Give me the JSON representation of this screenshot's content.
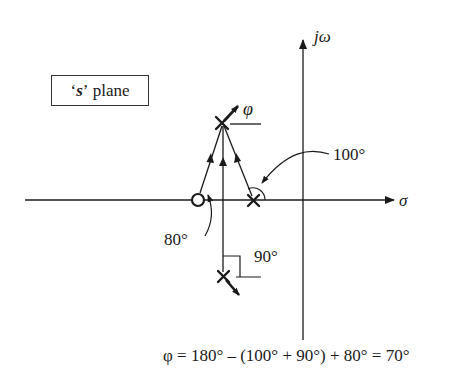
{
  "diagram": {
    "title_box": {
      "quote_open": "‘",
      "variable": "s",
      "quote_close": "’",
      "suffix": " plane"
    },
    "axes": {
      "imaginary_label": "jω",
      "real_label": "σ"
    },
    "departure_angle_label": "φ",
    "angle_labels": {
      "pole_right": "100°",
      "zero": "80°",
      "pole_lower": "90°"
    },
    "equation": "φ = 180° – (100° + 90°) + 80° = 70°",
    "elements": {
      "poles": [
        {
          "name": "upper-pole",
          "role": "departure pole"
        },
        {
          "name": "real-pole",
          "angle": "100°"
        },
        {
          "name": "lower-pole",
          "angle": "90°"
        }
      ],
      "zeros": [
        {
          "name": "real-zero",
          "angle": "80°"
        }
      ]
    },
    "colors": {
      "ink": "#1a1a1a",
      "background": "#ffffff"
    }
  }
}
